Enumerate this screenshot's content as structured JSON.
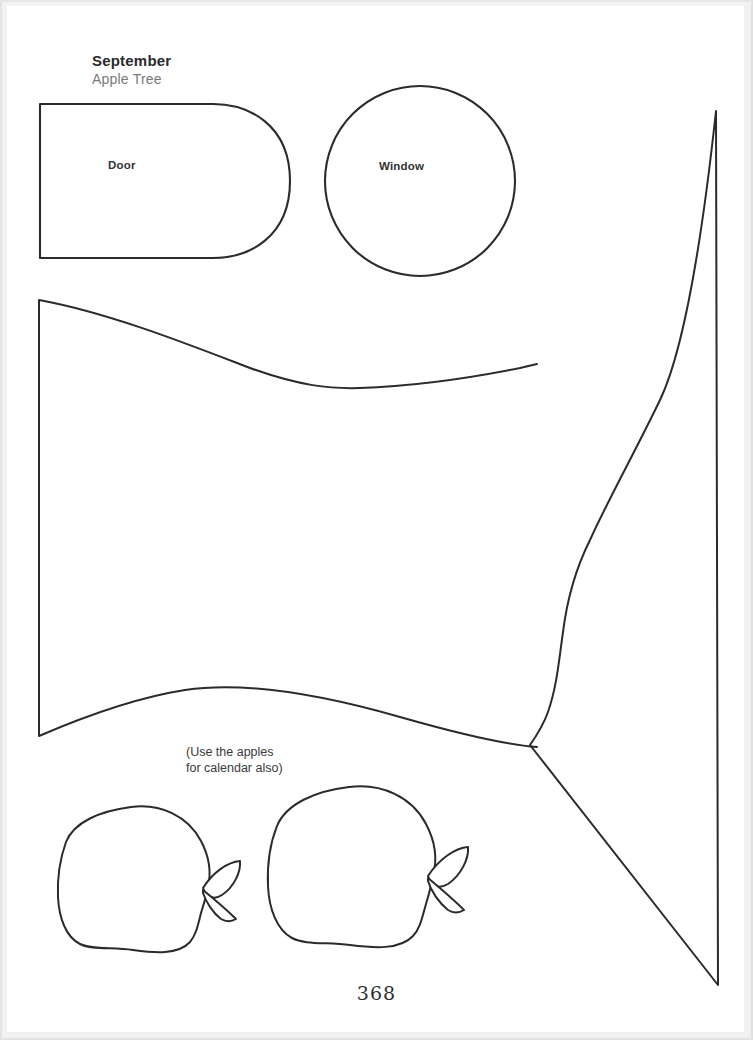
{
  "page": {
    "width": 753,
    "height": 1040,
    "background": "#ffffff",
    "ink_color": "#2b2b2b",
    "page_number": "368"
  },
  "header": {
    "month": "September",
    "subtitle": "Apple Tree",
    "month_color": "#2b2b2b",
    "subtitle_color": "#7a7a7a"
  },
  "labels": {
    "door": "Door",
    "window": "Window"
  },
  "note": {
    "line1": "(Use the apples",
    "line2": "for calendar also)",
    "text": "(Use the apples\nfor calendar also)"
  },
  "shapes": [
    {
      "name": "door-piece",
      "type": "rounded-arch-rectangle",
      "label": "Door",
      "bounds": {
        "x": 39,
        "y": 103,
        "width": 251,
        "height": 156
      }
    },
    {
      "name": "window-piece",
      "type": "circle",
      "label": "Window",
      "center": {
        "x": 420,
        "y": 181
      },
      "radius": 95
    },
    {
      "name": "tree-foliage-left-piece",
      "type": "freeform-curve",
      "label": "",
      "bounds": {
        "x": 38,
        "y": 299,
        "width": 500,
        "height": 440
      }
    },
    {
      "name": "tree-foliage-right-piece",
      "type": "freeform-curve",
      "label": "",
      "bounds": {
        "x": 528,
        "y": 110,
        "width": 190,
        "height": 875
      }
    },
    {
      "name": "apple-small",
      "type": "apple-outline",
      "label": "",
      "bounds": {
        "x": 57,
        "y": 805,
        "width": 185,
        "height": 145
      }
    },
    {
      "name": "apple-large",
      "type": "apple-outline",
      "label": "",
      "bounds": {
        "x": 268,
        "y": 785,
        "width": 198,
        "height": 152
      }
    }
  ]
}
